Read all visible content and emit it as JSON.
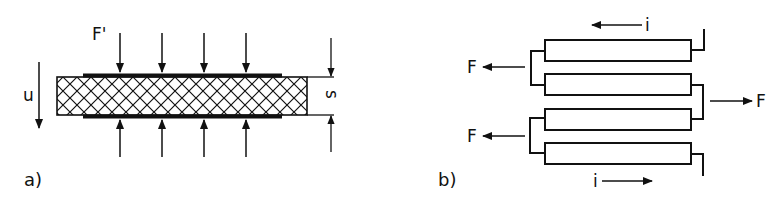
{
  "figure": {
    "panel_a": {
      "label": "a)",
      "force_label": "F'",
      "displacement_label": "u",
      "thickness_label": "s",
      "force_arrow_count": 4
    },
    "panel_b": {
      "label": "b)",
      "current_label_top": "i",
      "current_label_bottom": "i",
      "force_label_left_top": "F",
      "force_label_left_bottom": "F",
      "force_label_right": "F",
      "element_count": 4
    },
    "colors": {
      "ink": "#111111",
      "background": "#ffffff"
    }
  }
}
